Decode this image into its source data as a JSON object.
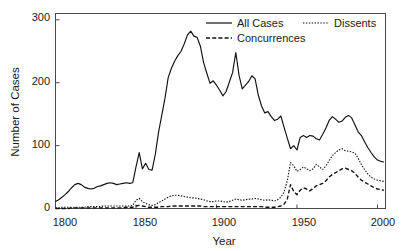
{
  "chart_data": {
    "type": "line",
    "title": "",
    "xlabel": "Year",
    "ylabel": "Number of Cases",
    "xlim": [
      1800,
      2005
    ],
    "ylim": [
      0,
      310
    ],
    "xticks": [
      1800,
      1850,
      1900,
      1950,
      2000
    ],
    "xtick_labels": [
      "1800",
      "1850",
      "1900",
      "1950",
      "2000"
    ],
    "yticks": [
      0,
      100,
      200,
      300
    ],
    "ytick_labels": [
      "0",
      "100",
      "200",
      "300"
    ],
    "grid": false,
    "legend_position": "top-right",
    "frame": true,
    "tick_direction": "in",
    "line_color": "#111111",
    "x": [
      1800,
      1802,
      1804,
      1806,
      1808,
      1810,
      1812,
      1814,
      1816,
      1818,
      1820,
      1822,
      1824,
      1826,
      1828,
      1830,
      1832,
      1834,
      1836,
      1838,
      1840,
      1842,
      1844,
      1846,
      1848,
      1850,
      1852,
      1854,
      1856,
      1858,
      1860,
      1862,
      1864,
      1866,
      1868,
      1870,
      1872,
      1874,
      1876,
      1878,
      1880,
      1882,
      1884,
      1886,
      1888,
      1890,
      1892,
      1894,
      1896,
      1898,
      1900,
      1902,
      1904,
      1906,
      1908,
      1910,
      1912,
      1914,
      1916,
      1918,
      1920,
      1922,
      1924,
      1926,
      1928,
      1930,
      1932,
      1934,
      1936,
      1938,
      1940,
      1942,
      1944,
      1946,
      1948,
      1950,
      1952,
      1954,
      1956,
      1958,
      1960,
      1962,
      1964,
      1966,
      1968,
      1970,
      1972,
      1974,
      1976,
      1978,
      1980,
      1982,
      1984,
      1986,
      1988,
      1990,
      1992,
      1994,
      1996,
      1998,
      2000,
      2002,
      2004
    ],
    "series": [
      {
        "name": "All Cases",
        "style": "solid",
        "values": [
          11,
          14,
          18,
          22,
          27,
          33,
          38,
          40,
          38,
          34,
          32,
          31,
          32,
          35,
          36,
          38,
          40,
          41,
          40,
          38,
          39,
          40,
          41,
          40,
          41,
          66,
          89,
          63,
          72,
          62,
          61,
          86,
          121,
          148,
          175,
          208,
          223,
          234,
          243,
          250,
          262,
          276,
          282,
          274,
          272,
          258,
          232,
          215,
          199,
          203,
          196,
          188,
          179,
          186,
          201,
          216,
          248,
          212,
          190,
          196,
          202,
          211,
          206,
          180,
          163,
          152,
          154,
          146,
          140,
          142,
          147,
          129,
          112,
          95,
          100,
          93,
          113,
          116,
          113,
          116,
          115,
          111,
          109,
          118,
          128,
          140,
          146,
          142,
          137,
          139,
          145,
          148,
          144,
          133,
          122,
          116,
          106,
          97,
          89,
          82,
          77,
          75,
          74
        ]
      },
      {
        "name": "Dissents",
        "style": "dotted",
        "values": [
          1,
          1,
          2,
          2,
          2,
          2,
          2,
          2,
          2,
          2,
          3,
          3,
          3,
          3,
          3,
          4,
          4,
          4,
          4,
          4,
          4,
          4,
          4,
          4,
          5,
          13,
          16,
          11,
          8,
          6,
          5,
          6,
          9,
          12,
          15,
          18,
          20,
          21,
          21,
          20,
          19,
          18,
          17,
          17,
          16,
          15,
          14,
          12,
          11,
          11,
          12,
          12,
          11,
          10,
          11,
          13,
          15,
          14,
          13,
          14,
          15,
          15,
          16,
          15,
          14,
          13,
          14,
          13,
          12,
          14,
          18,
          26,
          44,
          73,
          68,
          59,
          62,
          66,
          63,
          60,
          63,
          70,
          66,
          62,
          68,
          76,
          84,
          89,
          93,
          95,
          92,
          91,
          90,
          88,
          80,
          70,
          62,
          55,
          50,
          47,
          45,
          44,
          43
        ]
      },
      {
        "name": "Concurrences",
        "style": "dashed",
        "values": [
          0,
          0,
          0,
          0,
          0,
          1,
          1,
          1,
          1,
          1,
          1,
          1,
          1,
          1,
          1,
          1,
          1,
          1,
          1,
          1,
          1,
          1,
          2,
          2,
          2,
          4,
          5,
          4,
          3,
          2,
          2,
          2,
          2,
          3,
          3,
          3,
          4,
          4,
          4,
          4,
          4,
          4,
          4,
          4,
          4,
          4,
          3,
          3,
          3,
          3,
          3,
          3,
          3,
          3,
          3,
          3,
          3,
          3,
          3,
          3,
          3,
          3,
          3,
          3,
          3,
          2,
          2,
          2,
          2,
          3,
          4,
          7,
          15,
          38,
          27,
          22,
          29,
          33,
          31,
          28,
          32,
          36,
          38,
          40,
          44,
          50,
          54,
          57,
          60,
          63,
          64,
          62,
          60,
          56,
          50,
          45,
          42,
          39,
          36,
          33,
          31,
          30,
          29
        ]
      }
    ]
  },
  "legend": {
    "items": [
      {
        "label": "All Cases",
        "style": "solid"
      },
      {
        "label": "Dissents",
        "style": "dotted"
      },
      {
        "label": "Concurrences",
        "style": "dashed"
      }
    ]
  },
  "axes": {
    "x_title": "Year",
    "y_title": "Number of Cases"
  }
}
